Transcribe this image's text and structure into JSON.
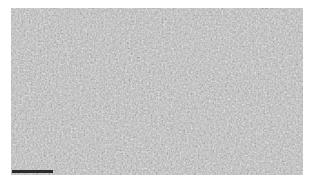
{
  "image": {
    "description": "Grayscale micrograph texture with scale bar",
    "colors": {
      "background": "#ffffff",
      "texture_base": "#bdbdbd",
      "texture_dark": "#8a8a8a",
      "texture_light": "#e0e0e0",
      "scalebar": "#2a2a2a"
    }
  },
  "scalebar": {
    "label": ""
  }
}
